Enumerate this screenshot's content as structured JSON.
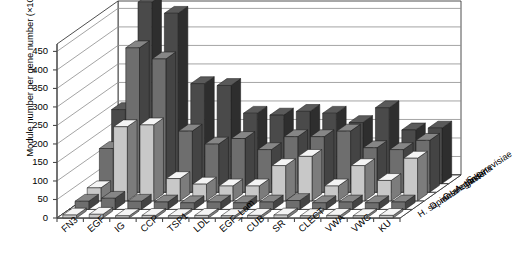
{
  "chart_data": {
    "type": "bar",
    "title": "",
    "xlabel": "",
    "ylabel": "Module number per gene number (×10000)",
    "ylim": [
      0,
      470
    ],
    "yticks": [
      0,
      50,
      100,
      150,
      200,
      250,
      300,
      350,
      400,
      450
    ],
    "grid": true,
    "legend_position": "right-floor-axis",
    "projection": "3d-columns",
    "categories": [
      "FN3",
      "EGF",
      "IG",
      "CCP",
      "TSP1",
      "LDL",
      "EGF_Lam",
      "CUB",
      "SR",
      "CLECT",
      "VWA",
      "VWC",
      "KU"
    ],
    "series": [
      {
        "name": "S. cerevisiae",
        "color": "#c8c8c8",
        "values": [
          8,
          10,
          6,
          7,
          6,
          7,
          6,
          7,
          8,
          6,
          7,
          6,
          7
        ]
      },
      {
        "name": "A. thaliana",
        "color": "#6e6e6e",
        "values": [
          22,
          30,
          22,
          20,
          18,
          20,
          18,
          20,
          24,
          18,
          20,
          18,
          20
        ]
      },
      {
        "name": "C. elegans",
        "color": "#c8c8c8",
        "values": [
          35,
          200,
          205,
          60,
          45,
          40,
          40,
          95,
          120,
          40,
          95,
          55,
          115
        ]
      },
      {
        "name": "D. melanogaster",
        "color": "#6e6e6e",
        "values": [
          118,
          390,
          360,
          165,
          130,
          145,
          115,
          150,
          150,
          165,
          120,
          115,
          140
        ]
      },
      {
        "name": "H. sapiens",
        "color": "#4a4a4a",
        "values": [
          200,
          490,
          460,
          270,
          265,
          190,
          185,
          195,
          190,
          165,
          205,
          145,
          150
        ]
      }
    ]
  },
  "axis": {
    "y_title": "Module number per gene number (×10000)",
    "tick_labels": [
      "450",
      "400",
      "350",
      "300",
      "250",
      "200",
      "150",
      "100",
      "50",
      "0"
    ]
  },
  "series_labels": [
    "H. sapiens",
    "D. melanogaster",
    "C. elegans",
    "A. thaliana",
    "S. cerevisiae"
  ],
  "category_labels": [
    "FN3",
    "EGF",
    "IG",
    "CCP",
    "TSP1",
    "LDL",
    "EGF_Lam",
    "CUB",
    "SR",
    "CLECT",
    "VWA",
    "VWC",
    "KU"
  ]
}
